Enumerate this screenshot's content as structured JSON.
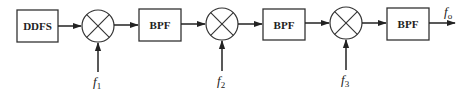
{
  "diagram": {
    "type": "block-diagram",
    "blocks": [
      {
        "id": "ddfs",
        "label": "DDFS"
      },
      {
        "id": "bpf1",
        "label": "BPF"
      },
      {
        "id": "bpf2",
        "label": "BPF"
      },
      {
        "id": "bpf3",
        "label": "BPF"
      }
    ],
    "mixers": [
      {
        "id": "mixer1",
        "symbol": "multiplier",
        "lo_input": {
          "var": "f",
          "sub": "1"
        }
      },
      {
        "id": "mixer2",
        "symbol": "multiplier",
        "lo_input": {
          "var": "f",
          "sub": "2"
        }
      },
      {
        "id": "mixer3",
        "symbol": "multiplier",
        "lo_input": {
          "var": "f",
          "sub": "3"
        }
      }
    ],
    "output": {
      "var": "f",
      "sub": "o"
    },
    "signal_chain": [
      "DDFS",
      "mixer1",
      "BPF",
      "mixer2",
      "BPF",
      "mixer3",
      "BPF",
      "output"
    ]
  }
}
